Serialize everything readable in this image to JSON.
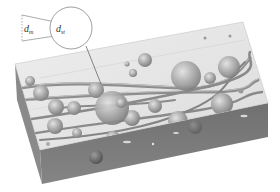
{
  "figure": {
    "type": "3D microstructure schematic",
    "labels": {
      "left_diameter": {
        "main": "d",
        "sub": "m"
      },
      "right_diameter": {
        "main": "d",
        "sub": "st"
      }
    },
    "colors": {
      "background": "#ffffff",
      "top_face": "#e4e4e4",
      "front_face": "#7d7d7d",
      "side_face": "#8c8c8c",
      "sphere": "#a9a9a9",
      "fiber": "#9a9a9a",
      "line": "#777777"
    },
    "spheres": [
      {
        "cx": 112,
        "cy": 108,
        "r": 16
      },
      {
        "cx": 186,
        "cy": 76,
        "r": 14
      },
      {
        "cx": 229,
        "cy": 68,
        "r": 11
      },
      {
        "cx": 222,
        "cy": 105,
        "r": 11
      },
      {
        "cx": 178,
        "cy": 121,
        "r": 10
      },
      {
        "cx": 145,
        "cy": 60,
        "r": 7
      },
      {
        "cx": 133,
        "cy": 73,
        "r": 4
      },
      {
        "cx": 127,
        "cy": 65,
        "r": 3
      },
      {
        "cx": 96,
        "cy": 90,
        "r": 8
      },
      {
        "cx": 41,
        "cy": 93,
        "r": 8
      },
      {
        "cx": 56,
        "cy": 107,
        "r": 8
      },
      {
        "cx": 74,
        "cy": 108,
        "r": 7
      },
      {
        "cx": 30,
        "cy": 80,
        "r": 5
      },
      {
        "cx": 55,
        "cy": 126,
        "r": 8
      },
      {
        "cx": 77,
        "cy": 133,
        "r": 5
      },
      {
        "cx": 155,
        "cy": 106,
        "r": 7
      },
      {
        "cx": 132,
        "cy": 118,
        "r": 8
      },
      {
        "cx": 210,
        "cy": 77,
        "r": 5
      },
      {
        "cx": 113,
        "cy": 138,
        "r": 7
      },
      {
        "cx": 195,
        "cy": 127,
        "r": 7
      },
      {
        "cx": 96,
        "cy": 157,
        "r": 7
      },
      {
        "cx": 241,
        "cy": 91,
        "r": 2
      },
      {
        "cx": 68,
        "cy": 26,
        "r": 0
      }
    ],
    "fibers": [
      {
        "d": "M 20 88 C 70 80, 130 86, 180 88 S 240 70, 250 58",
        "w": 3
      },
      {
        "d": "M 18 100 C 80 96, 140 92, 200 92 S 245 84, 258 80",
        "w": 3
      },
      {
        "d": "M 25 120 C 80 112, 150 100, 210 86 S 245 60, 250 52",
        "w": 2.5
      },
      {
        "d": "M 30 134 C 90 124, 150 118, 200 110 S 240 94, 262 92",
        "w": 2.5
      },
      {
        "d": "M 40 140 C 100 136, 150 128, 190 110 S 225 80, 245 62",
        "w": 2
      },
      {
        "d": "M 60 108 C 100 104, 140 106, 175 100",
        "w": 2
      }
    ]
  }
}
